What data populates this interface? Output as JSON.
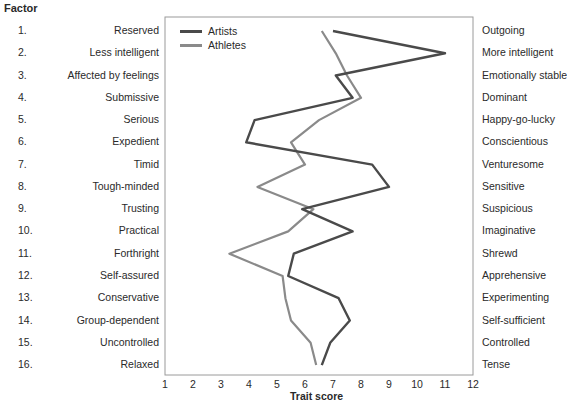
{
  "header": {
    "factor_label": "Factor"
  },
  "legend": {
    "items": [
      {
        "label": "Artists",
        "color": "#4a4a4a"
      },
      {
        "label": "Athletes",
        "color": "#8a8a8a"
      }
    ]
  },
  "rows": [
    {
      "num": "1.",
      "left": "Reserved",
      "right": "Outgoing"
    },
    {
      "num": "2.",
      "left": "Less intelligent",
      "right": "More intelligent"
    },
    {
      "num": "3.",
      "left": "Affected by feelings",
      "right": "Emotionally stable"
    },
    {
      "num": "4.",
      "left": "Submissive",
      "right": "Dominant"
    },
    {
      "num": "5.",
      "left": "Serious",
      "right": "Happy-go-lucky"
    },
    {
      "num": "6.",
      "left": "Expedient",
      "right": "Conscientious"
    },
    {
      "num": "7.",
      "left": "Timid",
      "right": "Venturesome"
    },
    {
      "num": "8.",
      "left": "Tough-minded",
      "right": "Sensitive"
    },
    {
      "num": "9.",
      "left": "Trusting",
      "right": "Suspicious"
    },
    {
      "num": "10.",
      "left": "Practical",
      "right": "Imaginative"
    },
    {
      "num": "11.",
      "left": "Forthright",
      "right": "Shrewd"
    },
    {
      "num": "12.",
      "left": "Self-assured",
      "right": "Apprehensive"
    },
    {
      "num": "13.",
      "left": "Conservative",
      "right": "Experimenting"
    },
    {
      "num": "14.",
      "left": "Group-dependent",
      "right": "Self-sufficient"
    },
    {
      "num": "15.",
      "left": "Uncontrolled",
      "right": "Controlled"
    },
    {
      "num": "16.",
      "left": "Relaxed",
      "right": "Tense"
    }
  ],
  "axis": {
    "ticks": [
      "1",
      "2",
      "3",
      "4",
      "5",
      "6",
      "7",
      "8",
      "9",
      "10",
      "11",
      "12"
    ],
    "xlabel": "Trait score"
  },
  "chart_data": {
    "type": "line",
    "title": "",
    "xlabel": "Trait score",
    "ylabel": "Factor",
    "xlim": [
      1,
      12
    ],
    "orientation": "horizontal-profile",
    "categories": [
      "Reserved / Outgoing",
      "Less intelligent / More intelligent",
      "Affected by feelings / Emotionally stable",
      "Submissive / Dominant",
      "Serious / Happy-go-lucky",
      "Expedient / Conscientious",
      "Timid / Venturesome",
      "Tough-minded / Sensitive",
      "Trusting / Suspicious",
      "Practical / Imaginative",
      "Forthright / Shrewd",
      "Self-assured / Apprehensive",
      "Conservative / Experimenting",
      "Group-dependent / Self-sufficient",
      "Uncontrolled / Controlled",
      "Relaxed / Tense"
    ],
    "series": [
      {
        "name": "Artists",
        "color": "#4a4a4a",
        "values": [
          7.0,
          11.0,
          7.1,
          7.7,
          4.2,
          3.9,
          8.4,
          9.0,
          5.9,
          7.7,
          5.6,
          5.4,
          7.2,
          7.6,
          6.9,
          6.6
        ]
      },
      {
        "name": "Athletes",
        "color": "#8a8a8a",
        "values": [
          6.6,
          7.1,
          7.5,
          8.0,
          6.5,
          5.5,
          6.0,
          4.3,
          6.3,
          5.4,
          3.3,
          5.2,
          5.3,
          5.5,
          6.2,
          6.4
        ]
      }
    ],
    "grid": false,
    "legend_position": "top-left inside"
  }
}
